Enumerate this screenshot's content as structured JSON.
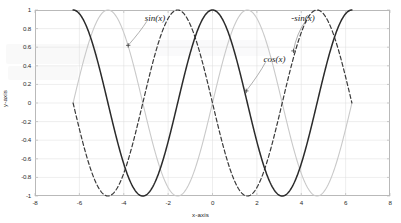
{
  "chart_data": {
    "type": "line",
    "title": "",
    "xlabel": "x-axis",
    "ylabel": "y-axis",
    "xlim": [
      -8,
      8
    ],
    "ylim": [
      -1,
      1
    ],
    "xticks": [
      -8,
      -6,
      -4,
      -2,
      0,
      2,
      4,
      6,
      8
    ],
    "xtick_labels": [
      "-8",
      "-6",
      "-4",
      "-2",
      "0",
      "2",
      "4",
      "6",
      "8"
    ],
    "yticks": [
      -1,
      -0.8,
      -0.6,
      -0.4,
      -0.2,
      0,
      0.2,
      0.4,
      0.6,
      0.8,
      1
    ],
    "ytick_labels": [
      "-1",
      "-0.8",
      "-0.6",
      "-0.4",
      "-0.2",
      "0",
      "0.2",
      "0.4",
      "0.6",
      "0.8",
      "1"
    ],
    "grid": true,
    "legend": "none",
    "x_domain": [
      -6.2832,
      6.2832
    ],
    "series": [
      {
        "name": "sin(x)",
        "formula": "sin",
        "style": "solid",
        "color": "#c9c9c9",
        "width": 1.1,
        "x": [
          -6.2832,
          -5.8905,
          -5.4978,
          -5.1051,
          -4.7124,
          -4.3197,
          -3.927,
          -3.5343,
          -3.1416,
          -2.7489,
          -2.3562,
          -1.9635,
          -1.5708,
          -1.1781,
          -0.7854,
          -0.3927,
          0,
          0.3927,
          0.7854,
          1.1781,
          1.5708,
          1.9635,
          2.3562,
          2.7489,
          3.1416,
          3.5343,
          3.927,
          4.3197,
          4.7124,
          5.1051,
          5.4978,
          5.8905,
          6.2832
        ],
        "y": [
          0,
          0.3827,
          0.7071,
          0.9239,
          1,
          0.9239,
          0.7071,
          0.3827,
          0,
          -0.3827,
          -0.7071,
          -0.9239,
          -1,
          -0.9239,
          -0.7071,
          -0.3827,
          0,
          0.3827,
          0.7071,
          0.9239,
          1,
          0.9239,
          0.7071,
          0.3827,
          0,
          -0.3827,
          -0.7071,
          -0.9239,
          -1,
          -0.9239,
          -0.7071,
          -0.3827,
          0
        ]
      },
      {
        "name": "-sin(x)",
        "formula": "-sin",
        "style": "dashed",
        "color": "#3a3a3a",
        "width": 1.2,
        "x": [
          -6.2832,
          -5.8905,
          -5.4978,
          -5.1051,
          -4.7124,
          -4.3197,
          -3.927,
          -3.5343,
          -3.1416,
          -2.7489,
          -2.3562,
          -1.9635,
          -1.5708,
          -1.1781,
          -0.7854,
          -0.3927,
          0,
          0.3927,
          0.7854,
          1.1781,
          1.5708,
          1.9635,
          2.3562,
          2.7489,
          3.1416,
          3.5343,
          3.927,
          4.3197,
          4.7124,
          5.1051,
          5.4978,
          5.8905,
          6.2832
        ],
        "y": [
          0,
          -0.3827,
          -0.7071,
          -0.9239,
          -1,
          -0.9239,
          -0.7071,
          -0.3827,
          0,
          0.3827,
          0.7071,
          0.9239,
          1,
          0.9239,
          0.7071,
          0.3827,
          0,
          -0.3827,
          -0.7071,
          -0.9239,
          -1,
          -0.9239,
          -0.7071,
          -0.3827,
          0,
          0.3827,
          0.7071,
          0.9239,
          1,
          0.9239,
          0.7071,
          0.3827,
          0
        ]
      },
      {
        "name": "cos(x)",
        "formula": "cos",
        "style": "solid",
        "color": "#2b2b2b",
        "width": 1.5,
        "x": [
          -6.2832,
          -5.8905,
          -5.4978,
          -5.1051,
          -4.7124,
          -4.3197,
          -3.927,
          -3.5343,
          -3.1416,
          -2.7489,
          -2.3562,
          -1.9635,
          -1.5708,
          -1.1781,
          -0.7854,
          -0.3927,
          0,
          0.3927,
          0.7854,
          1.1781,
          1.5708,
          1.9635,
          2.3562,
          2.7489,
          3.1416,
          3.5343,
          3.927,
          4.3197,
          4.7124,
          5.1051,
          5.4978,
          5.8905,
          6.2832
        ],
        "y": [
          1,
          0.9239,
          0.7071,
          0.3827,
          0,
          -0.3827,
          -0.7071,
          -0.9239,
          -1,
          -0.9239,
          -0.7071,
          -0.3827,
          0,
          0.3827,
          0.7071,
          0.9239,
          1,
          0.9239,
          0.7071,
          0.3827,
          0,
          -0.3827,
          -0.7071,
          -0.9239,
          -1,
          -0.9239,
          -0.7071,
          -0.3827,
          0,
          0.3827,
          0.7071,
          0.9239,
          1
        ]
      }
    ],
    "annotations": [
      {
        "text": "sin(x)",
        "label_x": -3.05,
        "label_y": 0.9,
        "point_x": -3.8,
        "point_y": 0.62
      },
      {
        "text": "-sin(x)",
        "label_x": 3.55,
        "label_y": 0.9,
        "point_x": 3.65,
        "point_y": 0.56
      },
      {
        "text": "cos(x)",
        "label_x": 2.3,
        "label_y": 0.46,
        "point_x": 1.52,
        "point_y": 0.13
      }
    ]
  },
  "colors": {
    "axis": "#b9b9b9",
    "grid": "#dcdcdc",
    "text": "#2b2b2b",
    "sin": "#c9c9c9",
    "neg_sin": "#3a3a3a",
    "cos": "#2b2b2b"
  }
}
